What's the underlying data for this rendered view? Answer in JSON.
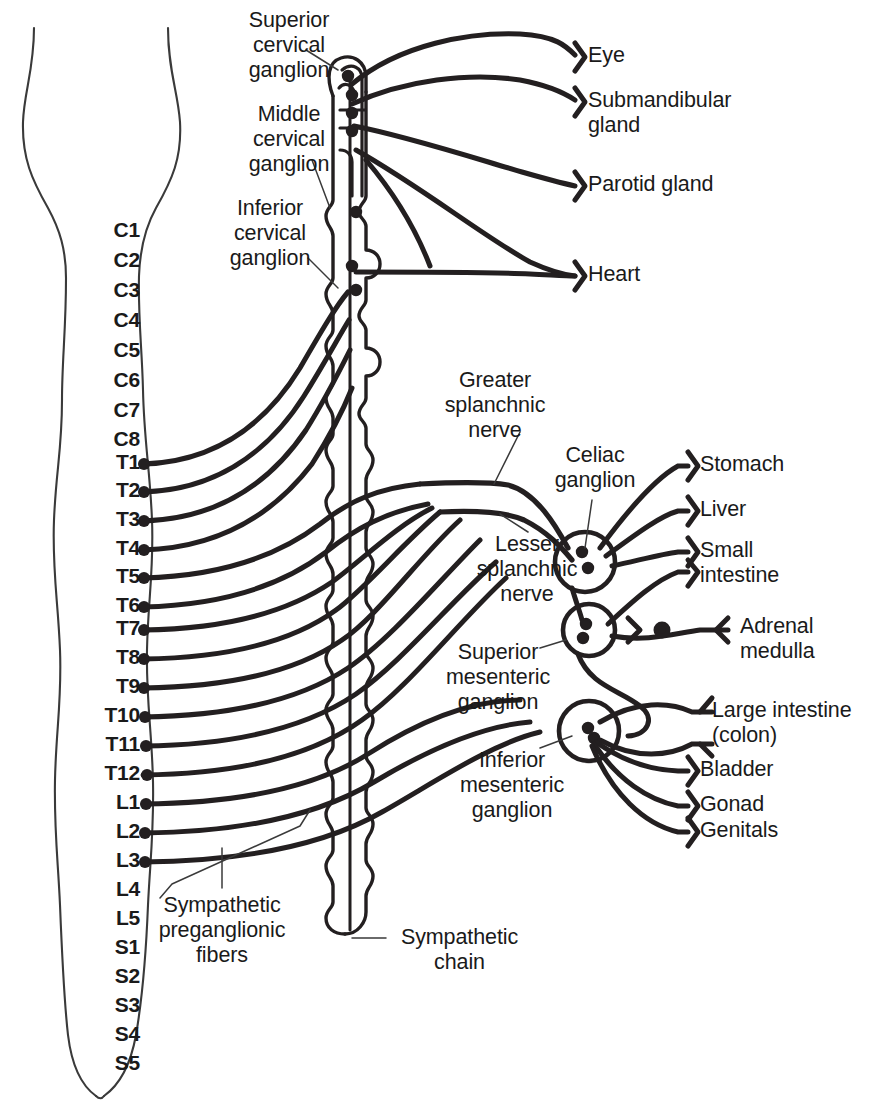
{
  "diagram": {
    "ink_color": "#231f20",
    "outline_color": "#3a3a3a",
    "background": "#ffffff"
  },
  "spinal_cord": {
    "segment_labels": [
      {
        "id": "C1",
        "label": "C1",
        "y": 232,
        "has_fiber": false
      },
      {
        "id": "C2",
        "label": "C2",
        "y": 262,
        "has_fiber": false
      },
      {
        "id": "C3",
        "label": "C3",
        "y": 292,
        "has_fiber": false
      },
      {
        "id": "C4",
        "label": "C4",
        "y": 322,
        "has_fiber": false
      },
      {
        "id": "C5",
        "label": "C5",
        "y": 352,
        "has_fiber": false
      },
      {
        "id": "C6",
        "label": "C6",
        "y": 382,
        "has_fiber": false
      },
      {
        "id": "C7",
        "label": "C7",
        "y": 412,
        "has_fiber": false
      },
      {
        "id": "C8",
        "label": "C8",
        "y": 441,
        "has_fiber": false
      },
      {
        "id": "T1",
        "label": "T1",
        "y": 464,
        "has_fiber": true
      },
      {
        "id": "T2",
        "label": "T2",
        "y": 492,
        "has_fiber": true
      },
      {
        "id": "T3",
        "label": "T3",
        "y": 521,
        "has_fiber": true
      },
      {
        "id": "T4",
        "label": "T4",
        "y": 550,
        "has_fiber": true
      },
      {
        "id": "T5",
        "label": "T5",
        "y": 578,
        "has_fiber": true
      },
      {
        "id": "T6",
        "label": "T6",
        "y": 607,
        "has_fiber": true
      },
      {
        "id": "T7",
        "label": "T7",
        "y": 630,
        "has_fiber": true
      },
      {
        "id": "T8",
        "label": "T8",
        "y": 659,
        "has_fiber": true
      },
      {
        "id": "T9",
        "label": "T9",
        "y": 688,
        "has_fiber": true
      },
      {
        "id": "T10",
        "label": "T10",
        "y": 717,
        "has_fiber": true
      },
      {
        "id": "T11",
        "label": "T11",
        "y": 746,
        "has_fiber": true
      },
      {
        "id": "T12",
        "label": "T12",
        "y": 775,
        "has_fiber": true
      },
      {
        "id": "L1",
        "label": "L1",
        "y": 804,
        "has_fiber": true
      },
      {
        "id": "L2",
        "label": "L2",
        "y": 833,
        "has_fiber": true
      },
      {
        "id": "L3",
        "label": "L3",
        "y": 862,
        "has_fiber": true
      },
      {
        "id": "L4",
        "label": "L4",
        "y": 891,
        "has_fiber": false
      },
      {
        "id": "L5",
        "label": "L5",
        "y": 920,
        "has_fiber": false
      },
      {
        "id": "S1",
        "label": "S1",
        "y": 949,
        "has_fiber": false
      },
      {
        "id": "S2",
        "label": "S2",
        "y": 978,
        "has_fiber": false
      },
      {
        "id": "S3",
        "label": "S3",
        "y": 1007,
        "has_fiber": false
      },
      {
        "id": "S4",
        "label": "S4",
        "y": 1036,
        "has_fiber": false
      },
      {
        "id": "S5",
        "label": "S5",
        "y": 1065,
        "has_fiber": false
      }
    ]
  },
  "ganglion_callouts": [
    {
      "id": "superior-cervical-ganglion",
      "label": "Superior\ncervical\nganglion",
      "x": 214,
      "y": 8,
      "width": 150,
      "align": "center"
    },
    {
      "id": "middle-cervical-ganglion",
      "label": "Middle\ncervical\nganglion",
      "x": 214,
      "y": 102,
      "width": 150,
      "align": "center"
    },
    {
      "id": "inferior-cervical-ganglion",
      "label": "Inferior\ncervical\nganglion",
      "x": 195,
      "y": 196,
      "width": 150,
      "align": "center"
    },
    {
      "id": "greater-splanchnic-nerve",
      "label": "Greater\nsplanchnic\nnerve",
      "x": 420,
      "y": 368,
      "width": 150,
      "align": "center"
    },
    {
      "id": "celiac-ganglion",
      "label": "Celiac\nganglion",
      "x": 530,
      "y": 443,
      "width": 130,
      "align": "center"
    },
    {
      "id": "lesser-splanchnic-nerve",
      "label": "Lesser\nsplanchnic\nnerve",
      "x": 452,
      "y": 532,
      "width": 150,
      "align": "center"
    },
    {
      "id": "superior-mesenteric-ganglion",
      "label": "Superior\nmesenteric\nganglion",
      "x": 418,
      "y": 640,
      "width": 160,
      "align": "center"
    },
    {
      "id": "inferior-mesenteric-ganglion",
      "label": "Inferior\nmesenteric\nganglion",
      "x": 432,
      "y": 748,
      "width": 160,
      "align": "center"
    },
    {
      "id": "sympathetic-preganglionic-fibers",
      "label": "Sympathetic\npreganglionic\nfibers",
      "x": 132,
      "y": 893,
      "width": 180,
      "align": "center"
    },
    {
      "id": "sympathetic-chain",
      "label": "Sympathetic\nchain",
      "x": 382,
      "y": 925,
      "width": 155,
      "align": "center"
    }
  ],
  "target_organs": [
    {
      "id": "eye",
      "label": "Eye",
      "x": 588,
      "y": 43,
      "terminal_x": 575,
      "terminal_y": 57
    },
    {
      "id": "submandibular-gland",
      "label": "Submandibular\ngland",
      "x": 588,
      "y": 88,
      "terminal_x": 575,
      "terminal_y": 102
    },
    {
      "id": "parotid-gland",
      "label": "Parotid gland",
      "x": 588,
      "y": 172,
      "terminal_x": 575,
      "terminal_y": 186
    },
    {
      "id": "heart",
      "label": "Heart",
      "x": 588,
      "y": 262,
      "terminal_x": 575,
      "terminal_y": 276
    },
    {
      "id": "stomach",
      "label": "Stomach",
      "x": 700,
      "y": 452,
      "terminal_x": 688,
      "terminal_y": 466
    },
    {
      "id": "liver",
      "label": "Liver",
      "x": 700,
      "y": 497,
      "terminal_x": 688,
      "terminal_y": 511
    },
    {
      "id": "small-intestine",
      "label": "Small\nintestine",
      "x": 700,
      "y": 538,
      "terminal_x": 688,
      "terminal_y": 552
    },
    {
      "id": "adrenal-medulla",
      "label": "Adrenal\nmedulla",
      "x": 740,
      "y": 614,
      "terminal_x": 728,
      "terminal_y": 630
    },
    {
      "id": "large-intestine",
      "label": "Large intestine\n(colon)",
      "x": 712,
      "y": 698,
      "terminal_x": 700,
      "terminal_y": 712
    },
    {
      "id": "bladder",
      "label": "Bladder",
      "x": 700,
      "y": 757,
      "terminal_x": 688,
      "terminal_y": 771
    },
    {
      "id": "gonad",
      "label": "Gonad",
      "x": 700,
      "y": 792,
      "terminal_x": 688,
      "terminal_y": 806
    },
    {
      "id": "genitals",
      "label": "Genitals",
      "x": 700,
      "y": 818,
      "terminal_x": 688,
      "terminal_y": 832
    }
  ],
  "prevertebral_ganglia": [
    {
      "id": "celiac-ganglion-node",
      "cx": 585,
      "cy": 562,
      "r": 30
    },
    {
      "id": "superior-mesenteric-ganglion-node",
      "cx": 589,
      "cy": 630,
      "r": 26
    },
    {
      "id": "inferior-mesenteric-ganglion-node",
      "cx": 589,
      "cy": 731,
      "r": 30
    }
  ]
}
